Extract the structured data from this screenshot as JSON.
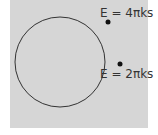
{
  "diagram": {
    "background_color": "#d6d6d6",
    "circle": {
      "cx": 60,
      "cy": 62,
      "r": 45,
      "stroke": "#333333"
    },
    "points": [
      {
        "name": "upper-point",
        "x": 108,
        "y": 22,
        "label": "E = 4πks",
        "label_x": 100,
        "label_y": 17
      },
      {
        "name": "lower-point",
        "x": 120,
        "y": 64,
        "label": "E = 2πks",
        "label_x": 100,
        "label_y": 78
      }
    ]
  }
}
